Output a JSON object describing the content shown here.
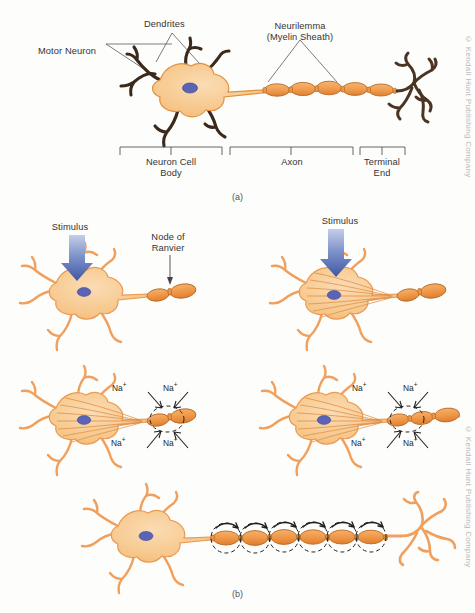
{
  "figure": {
    "title_a": "(a)",
    "title_b": "(b)",
    "copyright": "© Kendall Hunt Publishing Company"
  },
  "panel_a": {
    "labels": {
      "motor_neuron": "Motor Neuron",
      "dendrites": "Dendrites",
      "neurilemma_line1": "Neurilemma",
      "neurilemma_line2": "(Myelin Sheath)"
    },
    "brackets": [
      {
        "name": "neuron-cell-body",
        "line1": "Neuron Cell",
        "line2": "Body"
      },
      {
        "name": "axon",
        "line1": "Axon",
        "line2": ""
      },
      {
        "name": "terminal-end",
        "line1": "Terminal",
        "line2": "End"
      }
    ]
  },
  "panel_b": {
    "step1": {
      "stimulus": "Stimulus",
      "node_line1": "Node of",
      "node_line2": "Ranvier"
    },
    "step2": {
      "stimulus": "Stimulus"
    },
    "step3": {
      "ions": [
        "Na",
        "Na",
        "Na",
        "Na"
      ],
      "charge": "+"
    },
    "step4": {
      "ions": [
        "Na",
        "Na",
        "Na",
        "Na"
      ],
      "charge": "+"
    }
  },
  "colors": {
    "cell_fill": "#f7c98d",
    "cell_fill_light": "#fad9b0",
    "node_fill": "#ef9b4e",
    "outline_dark": "#3b2a1c",
    "outline_orange": "#e88b3c",
    "nucleus": "#5b63b5",
    "stimulus_arrow": "#4a63ae",
    "leader_line": "#555555"
  }
}
